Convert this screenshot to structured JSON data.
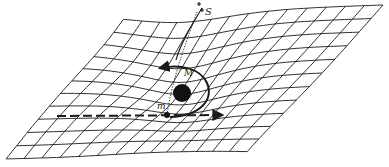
{
  "diagram": {
    "type": "spacetime-curvature-grid",
    "labels": {
      "star": "S",
      "central_mass": "M",
      "test_mass": "m"
    },
    "colors": {
      "ink": "#1a1a1a",
      "background": "#ffffff"
    },
    "grid": {
      "corners": {
        "top_left": [
          120,
          14
        ],
        "top_right": [
          383,
          5
        ],
        "bottom_right": [
          252,
          154
        ],
        "bottom_left": [
          6,
          159
        ]
      },
      "columns": 14,
      "rows": 11
    },
    "central_mass": {
      "cx": 182,
      "cy": 93,
      "r": 9
    },
    "test_mass": {
      "cx": 167,
      "cy": 115,
      "r": 3
    },
    "star_position": [
      200,
      8
    ]
  }
}
